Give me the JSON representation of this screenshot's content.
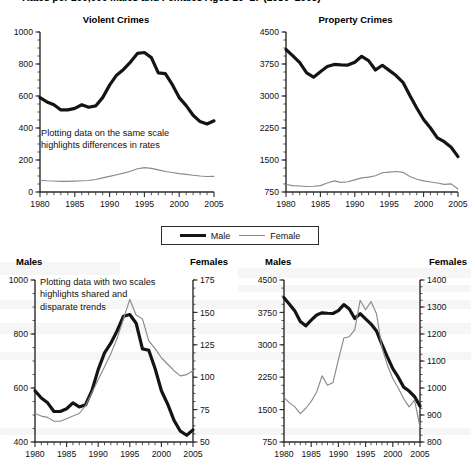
{
  "figure": {
    "bullet_icon": "bullet-icon",
    "title": "Rates per 100,000 Males and Females Ages 10–17 (1980–2005)"
  },
  "legend": {
    "position": "center-middle",
    "entries": [
      {
        "label": "Male",
        "style": "thick-black-line",
        "color": "#141414"
      },
      {
        "label": "Female",
        "style": "thin-gray-line",
        "color": "#8a8a8a"
      }
    ]
  },
  "annotations": [
    {
      "id": "annot-same-scale",
      "text": "Plotting data on the same scale\nhighlights differences in rates"
    },
    {
      "id": "annot-two-scales",
      "text": "Plotting data with two scales\nhighlights shared and\ndisparate trends"
    }
  ],
  "chart_data": [
    {
      "id": "violent-crimes-same-scale",
      "type": "line",
      "title": "Violent Crimes",
      "xlabel": "",
      "ylabel": "",
      "grid": false,
      "legend_position": "shared-below",
      "x": [
        1980,
        1981,
        1982,
        1983,
        1984,
        1985,
        1986,
        1987,
        1988,
        1989,
        1990,
        1991,
        1992,
        1993,
        1994,
        1995,
        1996,
        1997,
        1998,
        1999,
        2000,
        2001,
        2002,
        2003,
        2004,
        2005
      ],
      "xlim": [
        1980,
        2005
      ],
      "xticks": [
        1980,
        1985,
        1990,
        1995,
        2000,
        2005
      ],
      "xticklabels": [
        "1980",
        "1985",
        "1990",
        "1995",
        "2000",
        "2005"
      ],
      "ylim": [
        0,
        1000
      ],
      "yticks": [
        0,
        200,
        400,
        600,
        800,
        1000
      ],
      "yticklabels": [
        "0",
        "200",
        "400",
        "600",
        "800",
        "1000"
      ],
      "series": [
        {
          "name": "Male",
          "color": "#141414",
          "width": "thick",
          "values": [
            590,
            563,
            545,
            513,
            513,
            523,
            545,
            530,
            538,
            590,
            668,
            730,
            766,
            812,
            866,
            872,
            840,
            745,
            740,
            672,
            590,
            540,
            480,
            440,
            425,
            445
          ]
        },
        {
          "name": "Female",
          "color": "#8a8a8a",
          "width": "thin",
          "values": [
            72,
            70,
            69,
            66,
            66,
            68,
            70,
            72,
            78,
            88,
            98,
            108,
            118,
            130,
            145,
            152,
            148,
            138,
            128,
            122,
            115,
            110,
            105,
            100,
            97,
            98
          ]
        }
      ]
    },
    {
      "id": "property-crimes-same-scale",
      "type": "line",
      "title": "Property Crimes",
      "xlabel": "",
      "ylabel": "",
      "grid": false,
      "legend_position": "shared-below",
      "x": [
        1980,
        1981,
        1982,
        1983,
        1984,
        1985,
        1986,
        1987,
        1988,
        1989,
        1990,
        1991,
        1992,
        1993,
        1994,
        1995,
        1996,
        1997,
        1998,
        1999,
        2000,
        2001,
        2002,
        2003,
        2004,
        2005
      ],
      "xlim": [
        1980,
        2005
      ],
      "xticks": [
        1980,
        1985,
        1990,
        1995,
        2000,
        2005
      ],
      "xticklabels": [
        "1980",
        "1985",
        "1990",
        "1995",
        "2000",
        "2005"
      ],
      "ylim": [
        750,
        4500
      ],
      "yticks": [
        750,
        1500,
        2250,
        3000,
        3750,
        4500
      ],
      "yticklabels": [
        "750",
        "1500",
        "2250",
        "3000",
        "3750",
        "4500"
      ],
      "series": [
        {
          "name": "Male",
          "color": "#141414",
          "width": "thick",
          "values": [
            4090,
            3940,
            3780,
            3540,
            3440,
            3570,
            3690,
            3740,
            3730,
            3725,
            3790,
            3930,
            3830,
            3610,
            3720,
            3600,
            3480,
            3320,
            3010,
            2720,
            2450,
            2250,
            2020,
            1930,
            1800,
            1580
          ]
        },
        {
          "name": "Female",
          "color": "#8a8a8a",
          "width": "thin",
          "values": [
            925,
            900,
            890,
            880,
            885,
            900,
            960,
            1010,
            975,
            990,
            1035,
            1080,
            1100,
            1130,
            1200,
            1215,
            1230,
            1210,
            1115,
            1050,
            1010,
            985,
            960,
            930,
            940,
            820
          ]
        }
      ]
    },
    {
      "id": "violent-crimes-two-scales",
      "type": "line",
      "title": "",
      "left_axis_label": "Males",
      "right_axis_label": "Females",
      "grid": false,
      "x": [
        1980,
        1981,
        1982,
        1983,
        1984,
        1985,
        1986,
        1987,
        1988,
        1989,
        1990,
        1991,
        1992,
        1993,
        1994,
        1995,
        1996,
        1997,
        1998,
        1999,
        2000,
        2001,
        2002,
        2003,
        2004,
        2005
      ],
      "xlim": [
        1980,
        2005
      ],
      "xticks": [
        1980,
        1985,
        1990,
        1995,
        2000,
        2005
      ],
      "xticklabels": [
        "1980",
        "1985",
        "1990",
        "1995",
        "2000",
        "2005"
      ],
      "ylim_left": [
        400,
        1000
      ],
      "yticks_left": [
        400,
        600,
        800,
        1000
      ],
      "yticklabels_left": [
        "400",
        "600",
        "800",
        "1000"
      ],
      "ylim_right": [
        50,
        175
      ],
      "yticks_right": [
        50,
        75,
        100,
        125,
        150,
        175
      ],
      "yticklabels_right": [
        "50",
        "75",
        "100",
        "125",
        "150",
        "175"
      ],
      "series": [
        {
          "name": "Male",
          "axis": "left",
          "color": "#141414",
          "width": "thick",
          "values": [
            590,
            563,
            545,
            513,
            513,
            523,
            545,
            530,
            538,
            590,
            668,
            730,
            766,
            812,
            866,
            872,
            840,
            745,
            740,
            672,
            590,
            540,
            480,
            440,
            425,
            445
          ]
        },
        {
          "name": "Female",
          "axis": "right",
          "color": "#8a8a8a",
          "width": "thin",
          "values": [
            72,
            70,
            69,
            66,
            66,
            68,
            70,
            72,
            78,
            88,
            98,
            108,
            118,
            130,
            145,
            160,
            148,
            145,
            128,
            122,
            115,
            110,
            105,
            101,
            102,
            105
          ]
        }
      ]
    },
    {
      "id": "property-crimes-two-scales",
      "type": "line",
      "title": "",
      "left_axis_label": "Males",
      "right_axis_label": "Females",
      "grid": false,
      "x": [
        1980,
        1981,
        1982,
        1983,
        1984,
        1985,
        1986,
        1987,
        1988,
        1989,
        1990,
        1991,
        1992,
        1993,
        1994,
        1995,
        1996,
        1997,
        1998,
        1999,
        2000,
        2001,
        2002,
        2003,
        2004,
        2005
      ],
      "xlim": [
        1980,
        2005
      ],
      "xticks": [
        1980,
        1985,
        1990,
        1995,
        2000,
        2005
      ],
      "xticklabels": [
        "1980",
        "1985",
        "1990",
        "1995",
        "2000",
        "2005"
      ],
      "ylim_left": [
        750,
        4500
      ],
      "yticks_left": [
        750,
        1500,
        2250,
        3000,
        3750,
        4500
      ],
      "yticklabels_left": [
        "750",
        "1500",
        "2250",
        "3000",
        "3750",
        "4500"
      ],
      "ylim_right": [
        800,
        1400
      ],
      "yticks_right": [
        800,
        900,
        1000,
        1100,
        1200,
        1300,
        1400
      ],
      "yticklabels_right": [
        "800",
        "900",
        "1000",
        "1100",
        "1200",
        "1300",
        "1400"
      ],
      "series": [
        {
          "name": "Male",
          "axis": "left",
          "color": "#141414",
          "width": "thick",
          "values": [
            4090,
            3940,
            3780,
            3540,
            3440,
            3570,
            3690,
            3740,
            3730,
            3725,
            3790,
            3930,
            3830,
            3610,
            3720,
            3600,
            3480,
            3320,
            3010,
            2720,
            2450,
            2250,
            2020,
            1930,
            1800,
            1580
          ]
        },
        {
          "name": "Female",
          "axis": "right",
          "color": "#8a8a8a",
          "width": "thin",
          "values": [
            965,
            945,
            930,
            905,
            925,
            950,
            985,
            1045,
            1010,
            1020,
            1105,
            1185,
            1190,
            1215,
            1325,
            1290,
            1320,
            1275,
            1150,
            1085,
            1035,
            1000,
            960,
            930,
            955,
            855
          ]
        }
      ]
    }
  ]
}
